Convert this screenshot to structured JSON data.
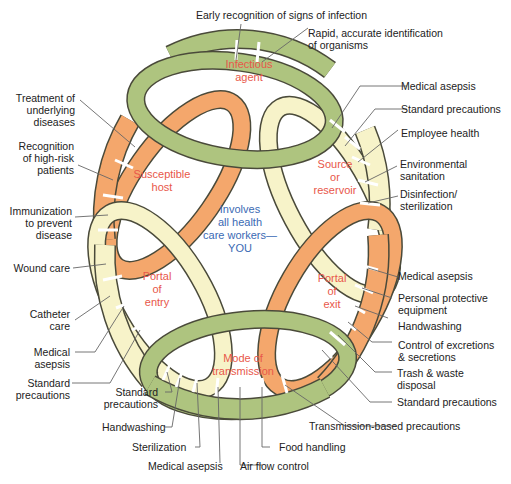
{
  "diagram": {
    "colors": {
      "green": "#aec47f",
      "orange": "#f4a76c",
      "cream": "#f7f3c9",
      "outline": "#4a4a3a",
      "ring_text": "#e8574a",
      "center_text": "#3b6ab4",
      "leader": "#666666"
    },
    "links": {
      "infectious_agent": [
        "Infectious",
        "agent"
      ],
      "source_reservoir": [
        "Source",
        "or",
        "reservoir"
      ],
      "portal_exit": [
        "Portal",
        "of",
        "exit"
      ],
      "mode_transmission": [
        "Mode of",
        "transmission"
      ],
      "portal_entry": [
        "Portal",
        "of",
        "entry"
      ],
      "susceptible_host": [
        "Susceptible",
        "host"
      ]
    },
    "center": [
      "Involves",
      "all health",
      "care workers—",
      "YOU"
    ],
    "labels": {
      "top1": "Early recognition of signs of infection",
      "top2": [
        "Rapid, accurate identification",
        "of organisms"
      ],
      "r1": "Medical asepsis",
      "r2": "Standard precautions",
      "r3": "Employee health",
      "r4": [
        "Environmental",
        "sanitation"
      ],
      "r5": [
        "Disinfection/",
        "sterilization"
      ],
      "r6": "Medical asepsis",
      "r7": [
        "Personal protective",
        "equipment"
      ],
      "r8": "Handwashing",
      "r9": [
        "Control of excretions",
        "& secretions"
      ],
      "r10": [
        "Trash & waste",
        "disposal"
      ],
      "r11": "Standard precautions",
      "b1": "Transmission-based precautions",
      "b2": "Food handling",
      "b3": "Air flow control",
      "b4": "Medical asepsis",
      "b5": "Sterilization",
      "b6": "Handwashing",
      "b7": [
        "Standard",
        "precautions"
      ],
      "l1": [
        "Standard",
        "precautions"
      ],
      "l2": [
        "Medical",
        "asepsis"
      ],
      "l3": [
        "Catheter",
        "care"
      ],
      "l4": "Wound care",
      "l5": [
        "Immunization",
        "to prevent",
        "disease"
      ],
      "l6": [
        "Recognition",
        "of high-risk",
        "patients"
      ],
      "l7": [
        "Treatment of",
        "underlying",
        "diseases"
      ]
    }
  }
}
